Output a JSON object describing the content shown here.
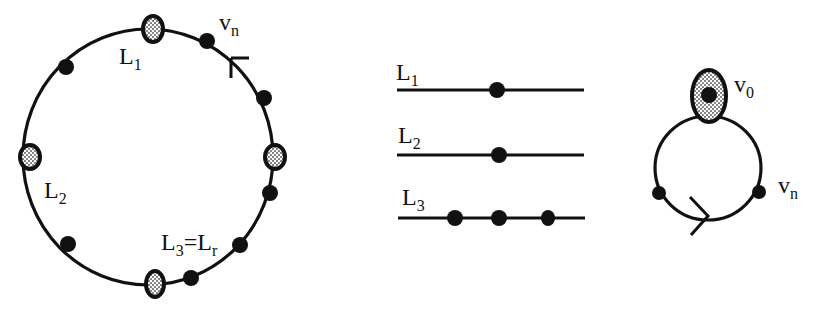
{
  "figure": {
    "left_panel": {
      "name": "cycle-with-vertices",
      "labels": {
        "vn": {
          "base": "v",
          "sub": "n"
        },
        "L1": {
          "base": "L",
          "sub": "1"
        },
        "L2": {
          "base": "L",
          "sub": "2"
        },
        "L3": {
          "base": "L",
          "sub": "3",
          "eq": "=L",
          "eq_sub": "r"
        }
      },
      "shaded_vertices": 4,
      "black_vertices": 8,
      "arrow": "counterclockwise-tick near v_n"
    },
    "middle_panel": {
      "name": "line-segments",
      "lines": [
        {
          "base": "L",
          "sub": "1",
          "dots": 1
        },
        {
          "base": "L",
          "sub": "2",
          "dots": 1
        },
        {
          "base": "L",
          "sub": "3",
          "dots": 3
        }
      ]
    },
    "right_panel": {
      "name": "loop-with-v0",
      "labels": {
        "v0": {
          "base": "v",
          "sub": "0"
        },
        "vn": {
          "base": "v",
          "sub": "n"
        }
      },
      "arrow": "clockwise at bottom"
    }
  },
  "colors": {
    "ink": "#111111",
    "background": "#ffffff",
    "shade": "#9a9a9a"
  }
}
